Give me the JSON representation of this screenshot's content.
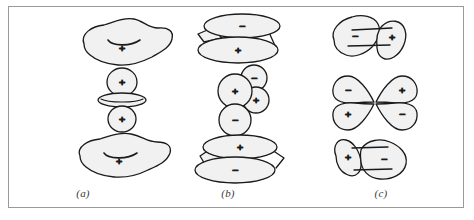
{
  "figure": {
    "border_color": "#9a9a9a",
    "background_color": "#ffffff",
    "outline_color": "#1a1a1a",
    "fill_color": "#f1f1f1",
    "sign_color": "#2a2a2a"
  },
  "captions": {
    "a": "(a)",
    "b": "(b)",
    "c": "(c)"
  },
  "panels": [
    {
      "id": "a",
      "caption": "(a)",
      "rows": [
        {
          "id": "a-top",
          "shape": "irregular-blob-with-arc",
          "signs": [
            "+"
          ]
        },
        {
          "id": "a-middle",
          "shape": "two-lobes-with-torus",
          "signs": [
            "+",
            "+"
          ]
        },
        {
          "id": "a-bottom",
          "shape": "irregular-blob-with-arc",
          "signs": [
            "+"
          ]
        }
      ]
    },
    {
      "id": "b",
      "caption": "(b)",
      "rows": [
        {
          "id": "b-top",
          "shape": "two-ellipses-prism",
          "signs": [
            "-",
            "+"
          ]
        },
        {
          "id": "b-middle",
          "shape": "four-circle-cluster",
          "signs": [
            "+",
            "-",
            "+",
            "-"
          ]
        },
        {
          "id": "b-bottom",
          "shape": "two-ellipses-prism",
          "signs": [
            "+",
            "-"
          ]
        }
      ]
    },
    {
      "id": "c",
      "caption": "(c)",
      "rows": [
        {
          "id": "c-top",
          "shape": "two-lobes-linked",
          "signs": [
            "-",
            "+"
          ]
        },
        {
          "id": "c-middle",
          "shape": "four-lobe-cloverleaf",
          "signs": [
            "-",
            "+",
            "+",
            "-"
          ]
        },
        {
          "id": "c-bottom",
          "shape": "two-lobes-linked",
          "signs": [
            "+",
            "-"
          ]
        }
      ]
    }
  ],
  "signs": {
    "plus": "+",
    "minus": "−"
  }
}
